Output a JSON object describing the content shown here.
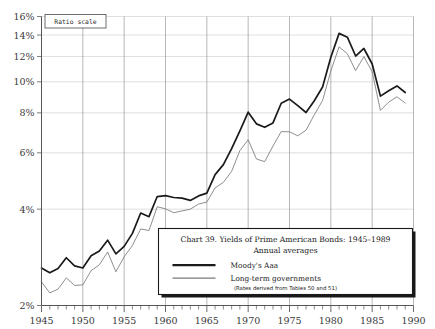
{
  "chart_data": {
    "type": "line",
    "title": "Chart 39. Yields of Prime American Bonds: 1945–1989",
    "subtitle": "Annual averages",
    "note": "(Rates derived from Tables 50 and 51)",
    "scale_label": "Ratio scale",
    "xlabel": "",
    "ylabel": "",
    "yscale": "log",
    "ylim": [
      2,
      16
    ],
    "xlim": [
      1945,
      1990
    ],
    "grid": true,
    "legend_position": "bottom-right",
    "ytick_labels": [
      "2%",
      "4%",
      "6%",
      "8%",
      "10%",
      "12%",
      "14%",
      "16%"
    ],
    "ytick_values": [
      2,
      4,
      6,
      8,
      10,
      12,
      14,
      16
    ],
    "xtick_labels": [
      "1945",
      "1950",
      "1955",
      "1960",
      "1965",
      "1970",
      "1975",
      "1980",
      "1985",
      "1990"
    ],
    "xtick_values": [
      1945,
      1950,
      1955,
      1960,
      1965,
      1970,
      1975,
      1980,
      1985,
      1990
    ],
    "x": [
      1945,
      1946,
      1947,
      1948,
      1949,
      1950,
      1951,
      1952,
      1953,
      1954,
      1955,
      1956,
      1957,
      1958,
      1959,
      1960,
      1961,
      1962,
      1963,
      1964,
      1965,
      1966,
      1967,
      1968,
      1969,
      1970,
      1971,
      1972,
      1973,
      1974,
      1975,
      1976,
      1977,
      1978,
      1979,
      1980,
      1981,
      1982,
      1983,
      1984,
      1985,
      1986,
      1987,
      1988,
      1989
    ],
    "series": [
      {
        "name": "Moody's Aaa",
        "color": "#1a1a1a",
        "width": 1.7,
        "values": [
          2.62,
          2.53,
          2.61,
          2.82,
          2.66,
          2.62,
          2.86,
          2.96,
          3.2,
          2.9,
          3.06,
          3.36,
          3.89,
          3.79,
          4.38,
          4.41,
          4.35,
          4.33,
          4.26,
          4.4,
          4.49,
          5.13,
          5.51,
          6.18,
          7.03,
          8.04,
          7.39,
          7.21,
          7.44,
          8.57,
          8.83,
          8.43,
          8.02,
          8.73,
          9.63,
          11.94,
          14.17,
          13.79,
          12.04,
          12.71,
          11.37,
          9.02,
          9.38,
          9.71,
          9.26
        ]
      },
      {
        "name": "Long-term governments",
        "color": "#7a7a7a",
        "width": 0.85,
        "values": [
          2.37,
          2.19,
          2.25,
          2.44,
          2.31,
          2.32,
          2.57,
          2.68,
          2.94,
          2.55,
          2.84,
          3.08,
          3.47,
          3.43,
          4.07,
          4.01,
          3.9,
          3.95,
          4.0,
          4.15,
          4.21,
          4.66,
          4.85,
          5.25,
          6.1,
          6.59,
          5.74,
          5.63,
          6.3,
          6.99,
          6.98,
          6.78,
          7.06,
          7.89,
          8.74,
          10.81,
          12.87,
          12.23,
          10.84,
          11.99,
          10.75,
          8.14,
          8.64,
          8.98,
          8.58
        ]
      }
    ]
  }
}
